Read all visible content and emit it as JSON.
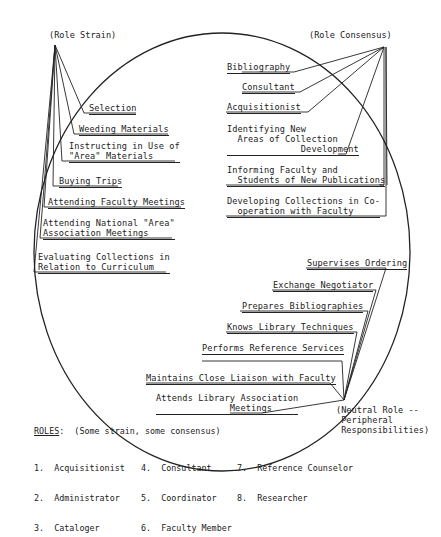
{
  "diagram": {
    "clusters": {
      "role_strain": {
        "label": "(Role Strain)",
        "items": [
          "Selection",
          "Weeding Materials",
          "Instructing in Use of\n\"Area\" Materials",
          "Buying Trips",
          "Attending Faculty Meetings",
          "Attending National \"Area\"\nAssociation Meetings",
          "Evaluating Collections in\nRelation to Curriculum"
        ]
      },
      "role_consensus": {
        "label": "(Role Consensus)",
        "items": [
          "Bibliography",
          "Consultant",
          "Acquisitionist",
          "Identifying New\n  Areas of Collection\n              Development",
          "Informing Faculty and\n  Students of New Publications",
          "Developing Collections in Co-\n  operation with Faculty"
        ]
      },
      "neutral_role": {
        "label": "(Neutral Role --\n Peripheral\n Responsibilities)",
        "items": [
          "Supervises Ordering",
          "Exchange Negotiator",
          "Prepares Bibliographies",
          "Knows Library Techniques",
          "Performs Reference Services",
          "Maintains Close Liaison with Faculty",
          "Attends Library Association\n              Meetings"
        ]
      }
    }
  },
  "legend": {
    "title": "ROLES",
    "subtitle": ":  (Some strain, some consensus)",
    "columns": [
      [
        "1.  Acquisitionist",
        "2.  Administrator",
        "3.  Cataloger"
      ],
      [
        "4.  Consultant",
        "5.  Coordinator",
        "6.  Faculty Member"
      ],
      [
        "7.  Reference Counselor",
        "8.  Researcher",
        ""
      ]
    ]
  }
}
